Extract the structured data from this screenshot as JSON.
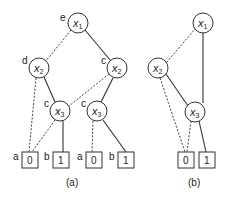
{
  "diagram": {
    "type": "binary-decision-diagram",
    "panel_a": {
      "caption": "(a)",
      "nodes": [
        {
          "id": "a_x1",
          "var": "x",
          "sub": "1",
          "label": "e"
        },
        {
          "id": "a_x2_left",
          "var": "x",
          "sub": "2",
          "label": "d"
        },
        {
          "id": "a_x2_right",
          "var": "x",
          "sub": "2",
          "label": "c"
        },
        {
          "id": "a_x3_left",
          "var": "x",
          "sub": "3",
          "label": "c"
        },
        {
          "id": "a_x3_right",
          "var": "x",
          "sub": "3",
          "label": "c"
        }
      ],
      "terminals": [
        {
          "id": "a_t0_left",
          "value": "0",
          "label": "a"
        },
        {
          "id": "a_t1_left",
          "value": "1",
          "label": "b"
        },
        {
          "id": "a_t0_right",
          "value": "0",
          "label": "a"
        },
        {
          "id": "a_t1_right",
          "value": "1",
          "label": "b"
        }
      ],
      "edges": [
        {
          "from": "a_x1",
          "to": "a_x2_left",
          "style": "dashed"
        },
        {
          "from": "a_x1",
          "to": "a_x2_right",
          "style": "solid"
        },
        {
          "from": "a_x2_left",
          "to": "a_t0_left",
          "style": "dashed"
        },
        {
          "from": "a_x2_left",
          "to": "a_x3_left",
          "style": "solid"
        },
        {
          "from": "a_x2_right",
          "to": "a_x3_left",
          "style": "dashed"
        },
        {
          "from": "a_x2_right",
          "to": "a_x3_right",
          "style": "solid"
        },
        {
          "from": "a_x3_left",
          "to": "a_t0_left",
          "style": "dashed"
        },
        {
          "from": "a_x3_left",
          "to": "a_t1_left",
          "style": "solid"
        },
        {
          "from": "a_x3_right",
          "to": "a_t0_right",
          "style": "dashed"
        },
        {
          "from": "a_x3_right",
          "to": "a_t1_right",
          "style": "solid"
        }
      ]
    },
    "panel_b": {
      "caption": "(b)",
      "nodes": [
        {
          "id": "b_x1",
          "var": "x",
          "sub": "1"
        },
        {
          "id": "b_x2",
          "var": "x",
          "sub": "2"
        },
        {
          "id": "b_x3",
          "var": "x",
          "sub": "3"
        }
      ],
      "terminals": [
        {
          "id": "b_t0",
          "value": "0"
        },
        {
          "id": "b_t1",
          "value": "1"
        }
      ],
      "edges": [
        {
          "from": "b_x1",
          "to": "b_x2",
          "style": "dashed"
        },
        {
          "from": "b_x1",
          "to": "b_x3",
          "style": "solid"
        },
        {
          "from": "b_x2",
          "to": "b_t0",
          "style": "dashed"
        },
        {
          "from": "b_x2",
          "to": "b_x3",
          "style": "solid"
        },
        {
          "from": "b_x3",
          "to": "b_t0",
          "style": "dashed"
        },
        {
          "from": "b_x3",
          "to": "b_t1",
          "style": "solid"
        }
      ]
    }
  }
}
